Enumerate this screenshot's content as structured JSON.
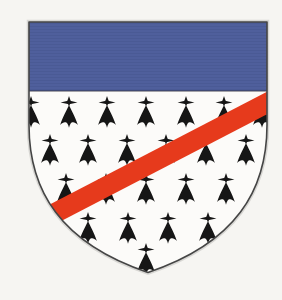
{
  "meta": {
    "type": "heraldic-shield"
  },
  "canvas": {
    "width": 282,
    "height": 300,
    "background": "#f6f5f2"
  },
  "colors": {
    "field": "#fcfbf9",
    "chief": "#4f5f9c",
    "chief_texture": "#45548c",
    "bend": "#e63a1c",
    "spot": "#161616",
    "outline": "#454545",
    "halo": "#cfcecb",
    "chief_separator": "#2e2e3c"
  },
  "shield": {
    "path": "M 29 22 H 267 V 125 C 267 190 236 243 148 272.5 C 60 243 29 190 29 125 Z",
    "chief": {
      "x": 29,
      "y": 22,
      "width": 238,
      "height": 69
    },
    "outline_width": 1.6,
    "halo_width": 4.5
  },
  "bend": {
    "x1": 292,
    "y1": 90,
    "x2": 24,
    "y2": 229,
    "stroke_width": 20
  },
  "ermine": {
    "spot_width": 22,
    "spot_height": 32,
    "spot_path_cross_v": "M12 0 L14.2 6.5 L12 11.5 L9.8 6.5 Z",
    "spot_path_cross_h": "M2.5 7.2 L12 5.2 L21.5 7.2 L12 9.2 Z",
    "spot_path_tail": "M12 10 C9.5 15.5 5.5 22.5 2 32.5 C5.5 29 8.6 28.8 10.3 31.2 C11.2 32.5 11.7 34 12 35.8 C12.3 34 12.8 32.5 13.7 31.2 C15.4 28.8 18.5 29 22 32.5 C18.5 22.5 14.5 15.5 12 10 Z",
    "rows": [
      {
        "y": 112,
        "xs": [
          31,
          69,
          107,
          146,
          186,
          224,
          262
        ]
      },
      {
        "y": 150,
        "xs": [
          50,
          88,
          127,
          166,
          206,
          246
        ]
      },
      {
        "y": 189,
        "xs": [
          66,
          106,
          146,
          186,
          226
        ]
      },
      {
        "y": 228,
        "xs": [
          88,
          128,
          168,
          208
        ]
      },
      {
        "y": 259,
        "xs": [
          146
        ]
      }
    ]
  }
}
